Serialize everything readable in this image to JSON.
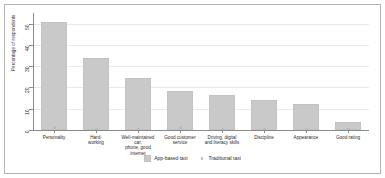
{
  "chart_data": {
    "type": "bar",
    "title": "",
    "subtitle": "",
    "xlabel": "",
    "ylabel": "Percentage of respondents",
    "ylim": [
      0,
      55
    ],
    "yticks": [
      0,
      10,
      20,
      30,
      40,
      50
    ],
    "ytick_labels": [
      "0",
      "10",
      "20",
      "30",
      "40",
      "50"
    ],
    "grid": true,
    "grid_axis": "y",
    "legend_position": "bottom-center",
    "categories": [
      "Personality",
      "Hard-\nworking",
      "Well-maintained car,\nphone, good internet",
      "Good customer\nservice",
      "Driving, digital\nand literacy skills",
      "Discipline",
      "Appearance",
      "Good rating"
    ],
    "series": [
      {
        "name": "App-based taxi",
        "type": "bar",
        "color": "#c9c9c9",
        "values": [
          51,
          34,
          24.5,
          18.5,
          16.5,
          14,
          12,
          4
        ]
      },
      {
        "name": "Traditional taxi",
        "type": "marker",
        "color": "#b8b8b8",
        "values": [
          51.8,
          34,
          24.5,
          19,
          16.5,
          14,
          12,
          4
        ]
      }
    ]
  },
  "axis": {
    "y_title": "Percentage of respondents",
    "y_ticks": [
      "50",
      "40",
      "30",
      "20",
      "10",
      "0"
    ]
  },
  "x_labels": [
    "Personality",
    "Hard-\nworking",
    "Well-maintained car,\nphone, good internet",
    "Good customer\nservice",
    "Driving, digital\nand literacy skills",
    "Discipline",
    "Appearance",
    "Good rating"
  ],
  "legend": {
    "items": [
      {
        "label": "App-based taxi",
        "marker": "square-swatch"
      },
      {
        "label": "Traditional taxi",
        "marker": "dot-marker"
      }
    ]
  }
}
